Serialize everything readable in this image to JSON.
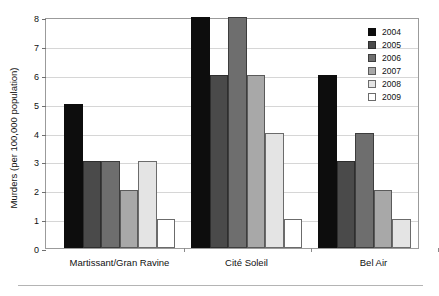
{
  "figure": {
    "top_clipped_text": "",
    "bottom_rule": true
  },
  "chart_data": {
    "type": "bar",
    "title": "",
    "xlabel": "",
    "ylabel": "Murders (per 100,000 population)",
    "ylim": [
      0,
      8
    ],
    "yticks": [
      0,
      1,
      2,
      3,
      4,
      5,
      6,
      7,
      8
    ],
    "ytick_labels": [
      "0",
      "1",
      "2",
      "3",
      "4",
      "5",
      "6",
      "7",
      "8"
    ],
    "grid": true,
    "grid_axis": "y",
    "legend_position": "top-right",
    "categories": [
      "Martissant/Gran Ravine",
      "Cité Soleil",
      "Bel Air"
    ],
    "series": [
      {
        "name": "2004",
        "color": "#0d0d0d",
        "border": "#0d0d0d",
        "values": [
          5,
          8,
          6
        ]
      },
      {
        "name": "2005",
        "color": "#4a4a4a",
        "border": "#2e2e2e",
        "values": [
          3,
          6,
          3
        ]
      },
      {
        "name": "2006",
        "color": "#6e6e6e",
        "border": "#3d3d3d",
        "values": [
          3,
          8,
          4
        ]
      },
      {
        "name": "2007",
        "color": "#a8a8a8",
        "border": "#5a5a5a",
        "values": [
          2,
          6,
          2
        ]
      },
      {
        "name": "2008",
        "color": "#e4e4e4",
        "border": "#6b6b6b",
        "values": [
          3,
          4,
          1
        ]
      },
      {
        "name": "2009",
        "color": "#ffffff",
        "border": "#6b6b6b",
        "values": [
          1,
          1,
          0
        ]
      }
    ]
  },
  "legend": {
    "entries": [
      {
        "label": "2004",
        "color": "#0d0d0d",
        "border": "#0d0d0d"
      },
      {
        "label": "2005",
        "color": "#4a4a4a",
        "border": "#2e2e2e"
      },
      {
        "label": "2006",
        "color": "#6e6e6e",
        "border": "#3d3d3d"
      },
      {
        "label": "2007",
        "color": "#a8a8a8",
        "border": "#5a5a5a"
      },
      {
        "label": "2008",
        "color": "#e4e4e4",
        "border": "#6b6b6b"
      },
      {
        "label": "2009",
        "color": "#ffffff",
        "border": "#6b6b6b"
      }
    ]
  }
}
